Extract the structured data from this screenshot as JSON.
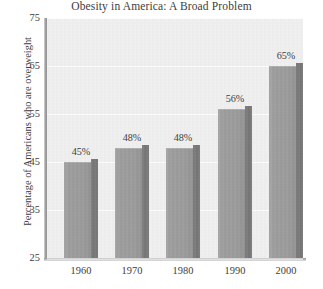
{
  "chart_data": {
    "type": "bar",
    "title": "Obesity in America: A Broad Problem",
    "xlabel": "",
    "ylabel": "Percentage of Americans who are overweight",
    "categories": [
      "1960",
      "1970",
      "1980",
      "1990",
      "2000"
    ],
    "values": [
      45,
      48,
      48,
      56,
      65
    ],
    "data_labels": [
      "45%",
      "48%",
      "48%",
      "56%",
      "65%"
    ],
    "ylim": [
      25,
      75
    ],
    "y_ticks": [
      25,
      35,
      45,
      55,
      65,
      75
    ],
    "y_tick_labels": [
      "25",
      "35",
      "45",
      "55",
      "65",
      "75"
    ],
    "grid": true,
    "legend": false,
    "series": [
      {
        "name": "Percentage of Americans who are overweight",
        "values": [
          45,
          48,
          48,
          56,
          65
        ]
      }
    ],
    "colors": {
      "bar_face": "#959595",
      "bar_side": "#6e6e6e",
      "plot_background": "#efefef",
      "page_background": "#ffffff",
      "text": "#3d3d3d",
      "gridline": "#ffffff",
      "axis": "#a6a6a6"
    }
  }
}
